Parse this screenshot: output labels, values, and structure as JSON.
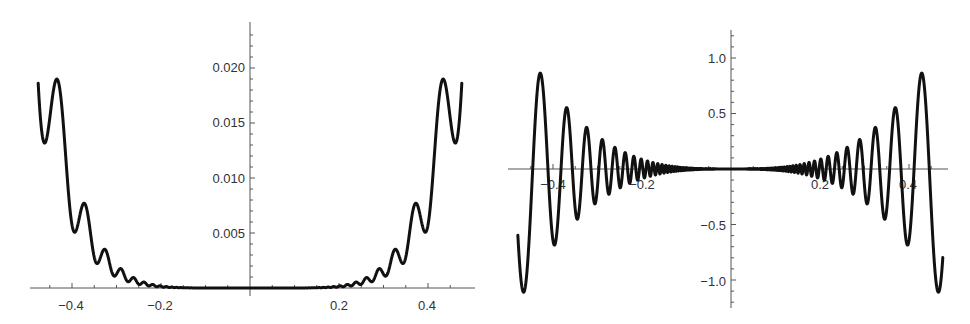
{
  "chart_data": [
    {
      "type": "line",
      "title": "",
      "xlabel": "",
      "ylabel": "",
      "xlim": [
        -0.48,
        0.48
      ],
      "ylim": [
        0,
        0.0235
      ],
      "grid": false,
      "legend": null,
      "x_ticks": [
        -0.4,
        -0.2,
        0.2,
        0.4
      ],
      "x_tick_labels": [
        "−0.4",
        "−0.2",
        "0.2",
        "0.4"
      ],
      "y_ticks": [
        0.005,
        0.01,
        0.015,
        0.02
      ],
      "y_tick_labels": [
        "0.005",
        "0.010",
        "0.015",
        "0.020"
      ],
      "description": "Even, non-negative oscillating function; oscillation frequency increases toward x=0 and amplitude decays to ~0 for |x|<0.2",
      "key_points": [
        {
          "x": -0.475,
          "y": 0.0153
        },
        {
          "x": -0.465,
          "y": 0.0105
        },
        {
          "x": -0.445,
          "y": 0.0228
        },
        {
          "x": -0.42,
          "y": 0.0055
        },
        {
          "x": -0.4,
          "y": 0.012
        },
        {
          "x": -0.385,
          "y": 0.003
        },
        {
          "x": -0.365,
          "y": 0.0067
        },
        {
          "x": -0.35,
          "y": 0.0018
        },
        {
          "x": -0.335,
          "y": 0.004
        },
        {
          "x": -0.2,
          "y": 0.0
        },
        {
          "x": 0.0,
          "y": 0.0
        },
        {
          "x": 0.2,
          "y": 0.0
        },
        {
          "x": 0.335,
          "y": 0.004
        },
        {
          "x": 0.35,
          "y": 0.0018
        },
        {
          "x": 0.365,
          "y": 0.0067
        },
        {
          "x": 0.385,
          "y": 0.003
        },
        {
          "x": 0.4,
          "y": 0.012
        },
        {
          "x": 0.42,
          "y": 0.0055
        },
        {
          "x": 0.445,
          "y": 0.0228
        },
        {
          "x": 0.465,
          "y": 0.0105
        },
        {
          "x": 0.475,
          "y": 0.0153
        }
      ],
      "model": {
        "amp": 2.15,
        "power": 6,
        "mod": 0.38,
        "k": 16.8,
        "phase": 0.0
      },
      "pixel_frame": {
        "x0": 250,
        "y0": 288,
        "px_per_x": 445,
        "px_per_y": 11000,
        "axis_x_from": 30,
        "axis_x_to": 475,
        "axis_y_from": 22,
        "axis_y_to": 296
      }
    },
    {
      "type": "line",
      "title": "",
      "xlabel": "",
      "ylabel": "",
      "xlim": [
        -0.48,
        0.48
      ],
      "ylim": [
        -1.25,
        1.25
      ],
      "grid": false,
      "legend": null,
      "x_ticks": [
        -0.4,
        -0.2,
        0.2,
        0.4
      ],
      "x_tick_labels": [
        "−0.4",
        "−0.2",
        "0.2",
        "0.4"
      ],
      "y_ticks": [
        -1.0,
        -0.5,
        0.5,
        1.0
      ],
      "y_tick_labels": [
        "−1.0",
        "−0.5",
        "0.5",
        "1.0"
      ],
      "description": "Odd oscillating function with growing amplitude away from x=0; oscillation frequency increases toward x=0",
      "key_points": [
        {
          "x": -0.48,
          "y": -1.13
        },
        {
          "x": -0.455,
          "y": 0.86
        },
        {
          "x": -0.425,
          "y": -1.05
        },
        {
          "x": -0.405,
          "y": 0.57
        },
        {
          "x": -0.385,
          "y": -0.69
        },
        {
          "x": -0.37,
          "y": 0.4
        },
        {
          "x": -0.355,
          "y": -0.46
        },
        {
          "x": -0.34,
          "y": 0.28
        },
        {
          "x": -0.2,
          "y": 0.0
        },
        {
          "x": 0.0,
          "y": 0.0
        },
        {
          "x": 0.2,
          "y": 0.0
        },
        {
          "x": 0.34,
          "y": -0.28
        },
        {
          "x": 0.355,
          "y": 0.46
        },
        {
          "x": 0.385,
          "y": 0.68
        },
        {
          "x": 0.395,
          "y": -0.4
        },
        {
          "x": 0.41,
          "y": -0.59
        },
        {
          "x": 0.42,
          "y": 1.03
        },
        {
          "x": 0.44,
          "y": -0.86
        },
        {
          "x": 0.475,
          "y": 1.13
        }
      ],
      "model": {
        "amp": 11.0,
        "power": 3,
        "k": 16.8,
        "phase": 0.0
      },
      "pixel_frame": {
        "x0": 731,
        "y0": 169,
        "px_per_x": 445,
        "px_per_y": 111,
        "axis_x_from": 508,
        "axis_x_to": 948,
        "axis_y_from": 30,
        "axis_y_to": 308
      }
    }
  ]
}
